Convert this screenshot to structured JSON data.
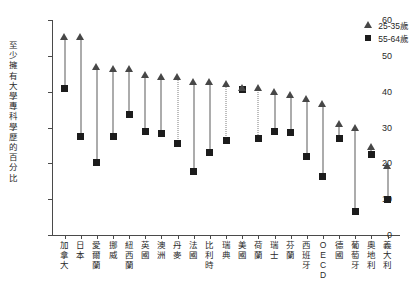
{
  "chart_data": {
    "type": "scatter",
    "title": "",
    "xlabel": "",
    "ylabel": "至少擁有大學專科學歷的百分比",
    "ylim": [
      0,
      60
    ],
    "yticks": [
      0,
      10,
      20,
      30,
      40,
      50,
      60
    ],
    "grid": false,
    "legend_position": "top-right",
    "categories": [
      "加拿大",
      "日本",
      "愛爾蘭",
      "挪威",
      "紐西蘭",
      "英國",
      "澳洲",
      "丹麥",
      "法國",
      "比利時",
      "瑞典",
      "美國",
      "荷蘭",
      "瑞士",
      "芬蘭",
      "西班牙",
      "OECD",
      "德國",
      "葡萄牙",
      "奧地利",
      "義大利"
    ],
    "series": [
      {
        "name": "25-35歲",
        "marker": "triangle",
        "values": [
          55.2,
          55.2,
          47.0,
          46.4,
          46.4,
          44.6,
          44.2,
          44.0,
          42.6,
          42.6,
          42.2,
          41.0,
          41.0,
          40.0,
          39.0,
          38.0,
          36.5,
          31.0,
          30.0,
          24.5,
          19.2
        ]
      },
      {
        "name": "55-64歲",
        "marker": "square",
        "values": [
          40.8,
          27.4,
          20.2,
          27.4,
          33.6,
          28.8,
          28.4,
          25.6,
          17.8,
          23.0,
          26.4,
          40.6,
          26.8,
          28.8,
          28.6,
          22.0,
          16.2,
          27.0,
          6.6,
          22.6,
          9.8
        ]
      }
    ],
    "connector_styles": [
      "solid",
      "solid",
      "solid",
      "solid",
      "solid",
      "solid",
      "solid",
      "dashed",
      "solid",
      "solid",
      "dashed",
      "dashed",
      "dashed",
      "solid",
      "solid",
      "solid",
      "solid",
      "solid",
      "solid",
      "solid",
      "solid"
    ]
  },
  "legend": {
    "items": [
      {
        "label": "25-35歲",
        "glyph": "triangle-marker-icon"
      },
      {
        "label": "55-64歲",
        "glyph": "square-marker-icon"
      }
    ]
  }
}
